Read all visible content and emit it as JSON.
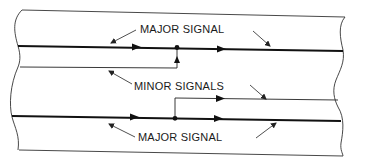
{
  "diagram": {
    "labels": {
      "major_signal_top": "MAJOR SIGNAL",
      "minor_signals": "MINOR SIGNALS",
      "major_signal_bottom": "MAJOR SIGNAL"
    },
    "elements": {
      "conductors": [
        {
          "id": "major-line-top",
          "type": "major"
        },
        {
          "id": "minor-line-top",
          "type": "minor",
          "joins": "major-line-top"
        },
        {
          "id": "minor-line-bottom",
          "type": "minor",
          "branches_from": "major-line-bottom"
        },
        {
          "id": "major-line-bottom",
          "type": "major"
        }
      ],
      "junctions": 2
    },
    "colors": {
      "line": "#222222",
      "background": "#ffffff"
    }
  }
}
